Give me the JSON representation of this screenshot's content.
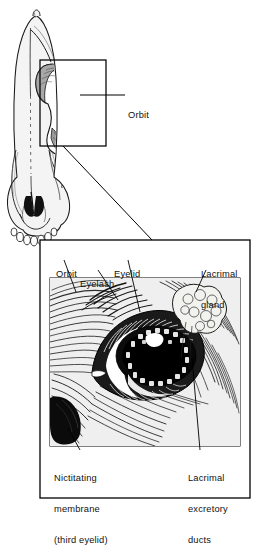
{
  "figure": {
    "type": "anatomical-illustration",
    "background": "#ffffff",
    "ink": "#111111"
  },
  "skull_panel": {
    "name": "skull-dorsal-view",
    "description": "Dorsal view of an elongated herbivore skull with nasal opening and incisor teeth at the muzzle",
    "callout_box": {
      "name": "orbit-callout-box",
      "x": 40,
      "y": 60,
      "width": 66,
      "height": 86
    },
    "labels": [
      {
        "id": "orbit-skull",
        "text": "Orbit"
      }
    ]
  },
  "detail_panel": {
    "name": "eye-detail-panel",
    "description": "Close-up engraving of the equine eye showing eyelashes, eyelid, lacrimal gland and nictitating membrane",
    "frame": {
      "x": 40,
      "y": 240,
      "width": 210,
      "height": 258
    },
    "labels": [
      {
        "id": "orbit-detail",
        "lines": [
          "Orbit"
        ]
      },
      {
        "id": "eyelash",
        "lines": [
          "Eyelash"
        ]
      },
      {
        "id": "eyelid",
        "lines": [
          "Eyelid"
        ]
      },
      {
        "id": "lacrimal-gland",
        "lines": [
          "Lacrimal",
          "gland"
        ]
      },
      {
        "id": "nictitating",
        "lines": [
          "Nictitating",
          "membrane",
          "(third eyelid)"
        ]
      },
      {
        "id": "lacrimal-ducts",
        "lines": [
          "Lacrimal",
          "excretory",
          "ducts"
        ]
      }
    ]
  },
  "labels": {
    "orbit_skull": "Orbit",
    "orbit_detail": "Orbit",
    "eyelash": "Eyelash",
    "eyelid": "Eyelid",
    "lacrimal_gland_1": "Lacrimal",
    "lacrimal_gland_2": "gland",
    "nictitating_1": "Nictitating",
    "nictitating_2": "membrane",
    "nictitating_3": "(third eyelid)",
    "lacrimal_ducts_1": "Lacrimal",
    "lacrimal_ducts_2": "excretory",
    "lacrimal_ducts_3": "ducts"
  }
}
